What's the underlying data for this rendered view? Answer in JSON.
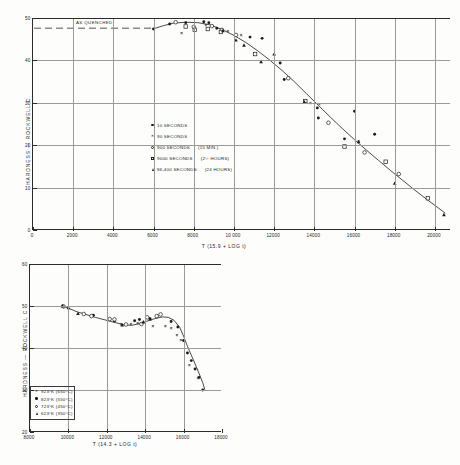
{
  "figure": {
    "top_chart": {
      "title": "",
      "xaxis_title": "T (15.9 + LOG t)",
      "yaxis_title": "HARDNESS  —  ROCKWELL   C",
      "x_ticks": [
        "0",
        "2000",
        "4000",
        "6000",
        "8000",
        "10 000",
        "12000",
        "14000",
        "16000",
        "18000",
        "20000"
      ],
      "y_ticks": [
        "0",
        "10",
        "20",
        "30",
        "40",
        "50"
      ],
      "annotation": "AS QUENCHED",
      "legend": [
        {
          "marker": "filled-circle",
          "label": "10   SECONDS",
          "note": ""
        },
        {
          "marker": "cross",
          "label": "90   SECONDS",
          "note": ""
        },
        {
          "marker": "open-circle",
          "label": "900 SECONDS",
          "note": "(15 MIN.)"
        },
        {
          "marker": "open-square",
          "label": "9000 SECONDS",
          "note": "(2½ HOURS)"
        },
        {
          "marker": "filled-triangle",
          "label": "86,400 SECONDS",
          "note": "(24 HOURS)"
        }
      ]
    },
    "bottom_chart": {
      "xaxis_title": "T (14.3 + LOG t)",
      "yaxis_title": "HARDNESS  —  ROCKWELL  C",
      "x_ticks": [
        "8000",
        "10000",
        "12000",
        "14000",
        "16000",
        "18000"
      ],
      "y_ticks": [
        "20",
        "30",
        "40",
        "50",
        "60"
      ],
      "legend": [
        {
          "marker": "cross",
          "label": "923°K  (650°C)"
        },
        {
          "marker": "filled-circle",
          "label": "823°K  (550°C)"
        },
        {
          "marker": "open-circle",
          "label": "723°K  (450°C)"
        },
        {
          "marker": "filled-triangle",
          "label": "623°K  (350°C)"
        }
      ]
    }
  },
  "chart_data": [
    {
      "type": "scatter",
      "id": "top",
      "title": "Hardness vs tempering parameter T (15.9 + LOG t)",
      "xlabel": "T (15.9 + LOG t)",
      "ylabel": "HARDNESS — ROCKWELL C",
      "xlim": [
        0,
        20800
      ],
      "ylim": [
        0,
        50
      ],
      "x_ticks": [
        0,
        2000,
        4000,
        6000,
        8000,
        10000,
        12000,
        14000,
        16000,
        18000,
        20000
      ],
      "y_ticks": [
        0,
        10,
        20,
        30,
        40,
        50
      ],
      "grid": true,
      "legend_position": "center-left",
      "annotations": [
        {
          "text": "AS QUENCHED",
          "x": 3000,
          "y": 47.6,
          "type": "dashed-reference-line",
          "line_y": 47.6
        }
      ],
      "series": [
        {
          "name": "10 SECONDS",
          "marker": "filled-circle",
          "points": [
            [
              6000,
              47.4
            ],
            [
              6800,
              48.6
            ],
            [
              7600,
              48.9
            ],
            [
              8500,
              49.1
            ],
            [
              8750,
              48.9
            ],
            [
              9150,
              47.6
            ],
            [
              9400,
              47.3
            ],
            [
              10800,
              45.5
            ],
            [
              11400,
              45.2
            ],
            [
              12300,
              39.4
            ],
            [
              12500,
              35.5
            ],
            [
              14150,
              28.8
            ],
            [
              14200,
              26.4
            ],
            [
              15500,
              21.5
            ],
            [
              16000,
              28.0
            ],
            [
              17000,
              22.6
            ]
          ]
        },
        {
          "name": "90 SECONDS",
          "marker": "cross",
          "points": [
            [
              7400,
              46.3
            ],
            [
              8600,
              48.2
            ],
            [
              9700,
              47.0
            ],
            [
              10350,
              46.0
            ],
            [
              13800,
              29.8
            ],
            [
              14250,
              29.7
            ],
            [
              16200,
              21.0
            ]
          ]
        },
        {
          "name": "900 SECONDS (15 MIN.)",
          "marker": "open-circle",
          "points": [
            [
              7100,
              49.0
            ],
            [
              8000,
              47.9
            ],
            [
              8900,
              48.1
            ],
            [
              9400,
              47.2
            ],
            [
              10100,
              46.0
            ],
            [
              12700,
              35.8
            ],
            [
              14700,
              25.3
            ],
            [
              16500,
              18.3
            ],
            [
              18200,
              13.2
            ]
          ]
        },
        {
          "name": "9000 SECONDS (2½ HOURS)",
          "marker": "open-square",
          "points": [
            [
              7600,
              48.0
            ],
            [
              8050,
              47.2
            ],
            [
              8700,
              47.4
            ],
            [
              9350,
              46.7
            ],
            [
              11050,
              41.5
            ],
            [
              13550,
              30.4
            ],
            [
              15500,
              19.7
            ],
            [
              17550,
              16.1
            ],
            [
              19650,
              7.5
            ]
          ]
        },
        {
          "name": "86,400 SECONDS (24 HOURS)",
          "marker": "filled-triangle",
          "points": [
            [
              9450,
              47.0
            ],
            [
              10100,
              44.8
            ],
            [
              10500,
              43.6
            ],
            [
              11350,
              39.7
            ],
            [
              12000,
              41.5
            ],
            [
              13500,
              30.2
            ],
            [
              16200,
              20.8
            ],
            [
              18000,
              11.0
            ],
            [
              20450,
              3.6
            ]
          ]
        }
      ],
      "fitted_curve": [
        [
          5950,
          47.4
        ],
        [
          6500,
          48.2
        ],
        [
          7000,
          48.8
        ],
        [
          7600,
          49.0
        ],
        [
          8200,
          48.9
        ],
        [
          8800,
          48.4
        ],
        [
          9400,
          47.3
        ],
        [
          10000,
          45.9
        ],
        [
          10600,
          44.2
        ],
        [
          11200,
          42.2
        ],
        [
          11800,
          40.0
        ],
        [
          12400,
          37.6
        ],
        [
          13000,
          35.0
        ],
        [
          13600,
          32.2
        ],
        [
          14200,
          29.4
        ],
        [
          14800,
          26.6
        ],
        [
          15400,
          23.9
        ],
        [
          16000,
          21.3
        ],
        [
          16600,
          18.8
        ],
        [
          17200,
          16.4
        ],
        [
          17800,
          14.0
        ],
        [
          18400,
          11.7
        ],
        [
          19000,
          9.4
        ],
        [
          19600,
          7.2
        ],
        [
          20200,
          5.1
        ],
        [
          20500,
          4.0
        ]
      ]
    },
    {
      "type": "scatter",
      "id": "bottom",
      "title": "Hardness vs tempering parameter T (14.3 + LOG t)",
      "xlabel": "T (14.3 + LOG t)",
      "ylabel": "HARDNESS — ROCKWELL C",
      "xlim": [
        8000,
        18000
      ],
      "ylim": [
        20,
        60
      ],
      "x_ticks": [
        8000,
        10000,
        12000,
        14000,
        16000,
        18000
      ],
      "y_ticks": [
        20,
        30,
        40,
        50,
        60
      ],
      "grid": true,
      "legend_position": "bottom-left",
      "series": [
        {
          "name": "923°K (650°C)",
          "marker": "cross",
          "points": [
            [
              12750,
              45.6
            ],
            [
              13250,
              45.7
            ],
            [
              13600,
              46.0
            ],
            [
              14400,
              45.2
            ],
            [
              15050,
              45.3
            ],
            [
              15350,
              44.6
            ],
            [
              15650,
              43.1
            ],
            [
              15850,
              41.8
            ],
            [
              16300,
              36.0
            ],
            [
              16750,
              32.8
            ]
          ]
        },
        {
          "name": "823°K (550°C)",
          "marker": "filled-circle",
          "points": [
            [
              9700,
              50.0
            ],
            [
              11300,
              47.8
            ],
            [
              12400,
              46.4
            ],
            [
              13450,
              46.5
            ],
            [
              13700,
              46.8
            ],
            [
              14250,
              47.0
            ],
            [
              15350,
              46.3
            ],
            [
              15700,
              45.0
            ],
            [
              16000,
              41.8
            ],
            [
              16200,
              38.8
            ],
            [
              16400,
              37.0
            ],
            [
              16600,
              35.0
            ],
            [
              16800,
              33.0
            ],
            [
              17000,
              30.0
            ]
          ]
        },
        {
          "name": "723°K (450°C)",
          "marker": "open-circle",
          "points": [
            [
              9750,
              49.9
            ],
            [
              10800,
              48.1
            ],
            [
              11200,
              47.6
            ],
            [
              12150,
              46.9
            ],
            [
              12400,
              46.8
            ],
            [
              13000,
              45.6
            ],
            [
              13800,
              45.7
            ],
            [
              14100,
              47.3
            ],
            [
              14600,
              47.6
            ],
            [
              14800,
              48.0
            ]
          ]
        },
        {
          "name": "623°K (350°C)",
          "marker": "filled-triangle",
          "points": [
            [
              9700,
              50.0
            ],
            [
              10000,
              49.6
            ],
            [
              10500,
              48.2
            ],
            [
              12800,
              45.5
            ],
            [
              13900,
              46.2
            ],
            [
              14250,
              46.9
            ]
          ]
        }
      ],
      "fitted_curve": [
        [
          9650,
          50.1
        ],
        [
          10000,
          49.5
        ],
        [
          10400,
          48.7
        ],
        [
          10900,
          48.0
        ],
        [
          11400,
          47.3
        ],
        [
          11900,
          46.7
        ],
        [
          12400,
          46.1
        ],
        [
          12900,
          45.5
        ],
        [
          13300,
          45.4
        ],
        [
          13700,
          45.8
        ],
        [
          14100,
          46.4
        ],
        [
          14500,
          47.0
        ],
        [
          14900,
          47.4
        ],
        [
          15200,
          47.3
        ],
        [
          15500,
          46.6
        ],
        [
          15800,
          44.9
        ],
        [
          16000,
          42.8
        ],
        [
          16200,
          40.4
        ],
        [
          16400,
          38.3
        ],
        [
          16600,
          36.2
        ],
        [
          16800,
          34.0
        ],
        [
          17000,
          31.7
        ],
        [
          17100,
          30.2
        ]
      ]
    }
  ]
}
